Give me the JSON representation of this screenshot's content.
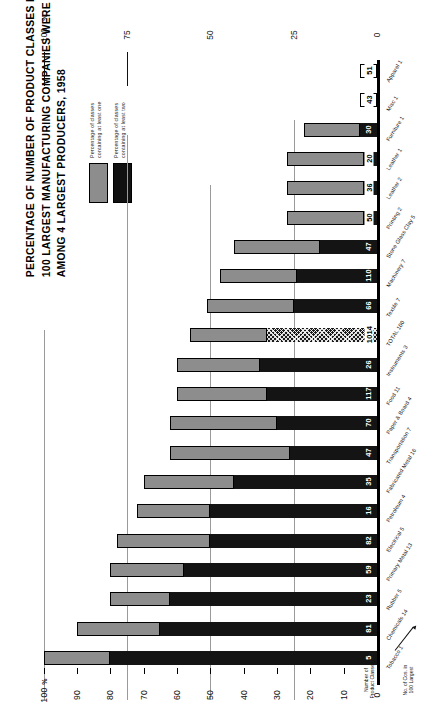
{
  "title": {
    "lines": [
      "PERCENTAGE OF NUMBER OF PRODUCT CLASSES IN WHICH",
      "100 LARGEST MANUFACTURING COMPANIES WERE REPRESENTED",
      "AMONG 4 LARGEST PRODUCERS, 1958"
    ]
  },
  "legend": {
    "items": [
      {
        "key": "one",
        "swatch": "#8d8d8d",
        "label": "Percentage of classes\ncontaining at least one"
      },
      {
        "key": "two",
        "swatch": "#141414",
        "label": "Percentage of classes\ncontaining at least two"
      }
    ]
  },
  "axes": {
    "percent_symbol": "%",
    "value_axis_title": "",
    "ticks": [
      "100",
      "90",
      "80",
      "70",
      "60",
      "50",
      "40",
      "30",
      "20",
      "10",
      "0"
    ],
    "top_ticks": [
      "100",
      "75",
      "50",
      "25",
      "0"
    ],
    "top_percent_symbol": "%",
    "count_axis_label": "Number of\nProduct Classes",
    "company_axis_label": "No. of Cos. in\n100 Largest"
  },
  "chart_data": {
    "type": "bar",
    "orientation": "horizontal-rotated",
    "title": "PERCENTAGE OF NUMBER OF PRODUCT CLASSES IN WHICH 100 LARGEST MANUFACTURING COMPANIES WERE REPRESENTED AMONG 4 LARGEST PRODUCERS, 1958",
    "xlabel": "",
    "ylabel": "%",
    "ylim": [
      0,
      100
    ],
    "grid": true,
    "legend_position": "top-left",
    "series": [
      {
        "name": "Percentage of classes containing at least one",
        "color": "#8d8d8d"
      },
      {
        "name": "Percentage of classes containing at least two",
        "color": "#141414"
      }
    ],
    "categories": [
      "Tobacco 1",
      "Chemicals 14",
      "Rubber 5",
      "Primary Metal 13",
      "Electrical 5",
      "Petroleum 4",
      "Fabricated Metal 16",
      "Transportation 7",
      "Paper & Board 4",
      "Food 11",
      "Instruments 3",
      "TOTAL 100",
      "Textile 7",
      "Machinery 7",
      "Stone Glass Clay 5",
      "Printing 2",
      "Leather 2",
      "Leather 1",
      "Furniture 1",
      "Misc 1",
      "Apparel 1"
    ],
    "bars": [
      {
        "label": "Tobacco",
        "companies": "1",
        "classes": "5",
        "at_least_one": 100,
        "at_least_two": 80,
        "style": "solid"
      },
      {
        "label": "Chemicals",
        "companies": "14",
        "classes": "81",
        "at_least_one": 90,
        "at_least_two": 65,
        "style": "solid"
      },
      {
        "label": "Rubber",
        "companies": "5",
        "classes": "23",
        "at_least_one": 80,
        "at_least_two": 62,
        "style": "solid"
      },
      {
        "label": "Primary Metal",
        "companies": "13",
        "classes": "59",
        "at_least_one": 80,
        "at_least_two": 58,
        "style": "solid"
      },
      {
        "label": "Electrical",
        "companies": "5",
        "classes": "82",
        "at_least_one": 78,
        "at_least_two": 50,
        "style": "solid"
      },
      {
        "label": "Petroleum",
        "companies": "4",
        "classes": "16",
        "at_least_one": 72,
        "at_least_two": 50,
        "style": "solid"
      },
      {
        "label": "Fabricated Metal",
        "companies": "16",
        "classes": "35",
        "at_least_one": 70,
        "at_least_two": 43,
        "style": "solid"
      },
      {
        "label": "Transportation",
        "companies": "7",
        "classes": "47",
        "at_least_one": 62,
        "at_least_two": 26,
        "style": "solid"
      },
      {
        "label": "Paper & Board",
        "companies": "4",
        "classes": "70",
        "at_least_one": 62,
        "at_least_two": 30,
        "style": "solid"
      },
      {
        "label": "Food",
        "companies": "11",
        "classes": "117",
        "at_least_one": 60,
        "at_least_two": 33,
        "style": "solid"
      },
      {
        "label": "Instruments",
        "companies": "3",
        "classes": "26",
        "at_least_one": 60,
        "at_least_two": 35,
        "style": "solid"
      },
      {
        "label": "TOTAL",
        "companies": "100",
        "classes": "1014",
        "at_least_one": 56,
        "at_least_two": 33,
        "style": "hatch"
      },
      {
        "label": "Textile",
        "companies": "7",
        "classes": "66",
        "at_least_one": 51,
        "at_least_two": 25,
        "style": "solid"
      },
      {
        "label": "Machinery",
        "companies": "7",
        "classes": "110",
        "at_least_one": 47,
        "at_least_two": 24,
        "style": "solid"
      },
      {
        "label": "Stone Glass Clay",
        "companies": "5",
        "classes": "47",
        "at_least_one": 43,
        "at_least_two": 17,
        "style": "solid"
      },
      {
        "label": "Printing",
        "companies": "2",
        "classes": "50",
        "at_least_one": 27,
        "at_least_two": 4,
        "style": "solid"
      },
      {
        "label": "Leather",
        "companies": "2",
        "classes": "36",
        "at_least_one": 27,
        "at_least_two": 4,
        "style": "solid"
      },
      {
        "label": "Leather",
        "companies": "1",
        "classes": "20",
        "at_least_one": 27,
        "at_least_two": 4,
        "style": "solid"
      },
      {
        "label": "Furniture",
        "companies": "1",
        "classes": "30",
        "at_least_one": 22,
        "at_least_two": 5,
        "style": "solid"
      },
      {
        "label": "Misc",
        "companies": "1",
        "classes": "43",
        "at_least_one": 0,
        "at_least_two": 5,
        "style": "open"
      },
      {
        "label": "Apparel",
        "companies": "1",
        "classes": "51",
        "at_least_one": 0,
        "at_least_two": 5,
        "style": "open"
      }
    ]
  }
}
